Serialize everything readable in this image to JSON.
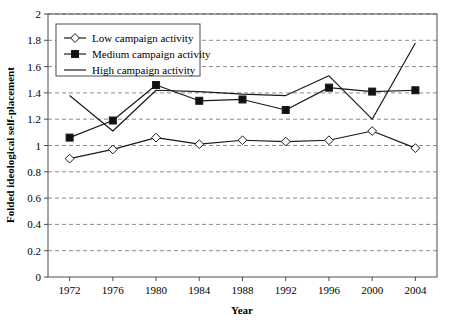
{
  "chart_data": {
    "type": "line",
    "title": "",
    "xlabel": "Year",
    "ylabel": "Folded ideological self-placement",
    "categories": [
      "1972",
      "1976",
      "1980",
      "1984",
      "1988",
      "1992",
      "1996",
      "2000",
      "2004"
    ],
    "x": [
      1972,
      1976,
      1980,
      1984,
      1988,
      1992,
      1996,
      2000,
      2004
    ],
    "xlim": [
      1970,
      2006
    ],
    "ylim": [
      0,
      2
    ],
    "yticks": [
      "0",
      "0.2",
      "0.4",
      "0.6",
      "0.8",
      "1",
      "1.2",
      "1.4",
      "1.6",
      "1.8",
      "2"
    ],
    "ytick_values": [
      0,
      0.2,
      0.4,
      0.6,
      0.8,
      1.0,
      1.2,
      1.4,
      1.6,
      1.8,
      2.0
    ],
    "grid": "horizontal-dashed",
    "legend_position": "top-left-inside",
    "series": [
      {
        "name": "Low campaign activity",
        "marker": "open-diamond",
        "values": [
          0.9,
          0.97,
          1.06,
          1.01,
          1.04,
          1.03,
          1.04,
          1.11,
          0.98
        ]
      },
      {
        "name": "Medium campaign activity",
        "marker": "filled-square",
        "values": [
          1.06,
          1.19,
          1.46,
          1.34,
          1.35,
          1.27,
          1.44,
          1.41,
          1.42
        ]
      },
      {
        "name": "High campaign activity",
        "marker": "none",
        "values": [
          1.38,
          1.11,
          1.42,
          1.41,
          1.39,
          1.38,
          1.53,
          1.2,
          1.78
        ]
      }
    ]
  },
  "legend": {
    "items": [
      {
        "label": "Low campaign activity"
      },
      {
        "label": "Medium campaign activity"
      },
      {
        "label": "High campaign activity"
      }
    ]
  },
  "colors": {
    "line": "#1a1a1a",
    "grid": "#8c8c8c",
    "axis": "#4d4d4d",
    "marker_fill": "#111111",
    "background": "#ffffff"
  }
}
